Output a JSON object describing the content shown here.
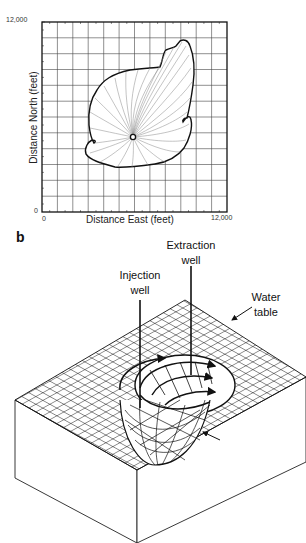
{
  "panel_a": {
    "x_axis": {
      "title": "Distance East (feet)",
      "min_label": "0",
      "max_label": "12,000",
      "range": [
        0,
        12000
      ],
      "grid_step": 1000
    },
    "y_axis": {
      "title": "Distance North (feet)",
      "min_label": "0",
      "max_label": "12,000",
      "range": [
        0,
        12000
      ],
      "grid_step": 1000
    },
    "features": {
      "plume_boundary": "Capture zone outline with radial flowlines converging to extraction well",
      "well_location_ft": [
        5800,
        4900
      ]
    }
  },
  "panel_b": {
    "letter": "b",
    "labels": {
      "extraction_line1": "Extraction",
      "extraction_line2": "well",
      "injection_line1": "Injection",
      "injection_line2": "well",
      "water_line1": "Water",
      "water_line2": "table",
      "dividing_line1": "Dividing",
      "dividing_line2": "surface"
    }
  },
  "colors": {
    "line": "#111111",
    "grid": "#333333",
    "flowline": "#777777",
    "background": "#ffffff"
  }
}
